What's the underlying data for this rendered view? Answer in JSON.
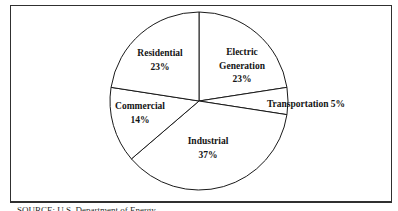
{
  "page": {
    "background": "#ffffff",
    "frame_border_color": "#303030"
  },
  "source_note": "SOURCE: U.S. Department of Energy",
  "chart_data": {
    "type": "pie",
    "unit": "percent",
    "start_angle_deg": -90,
    "direction": "clockwise",
    "fill": "#ffffff",
    "stroke": "#1a1a1a",
    "legend": "none",
    "labels_on_chart": true,
    "slices": [
      {
        "label": "Electric Generation",
        "value": 23,
        "label_lines": [
          "Electric",
          "Generation",
          "23%"
        ]
      },
      {
        "label": "Transportation",
        "value": 5,
        "label_lines": [
          "Transportation 5%"
        ]
      },
      {
        "label": "Industrial",
        "value": 37,
        "label_lines": [
          "Industrial",
          "37%"
        ]
      },
      {
        "label": "Commercial",
        "value": 14,
        "label_lines": [
          "Commercial",
          "14%"
        ]
      },
      {
        "label": "Residential",
        "value": 23,
        "label_lines": [
          "Residential",
          "23%"
        ]
      }
    ]
  }
}
